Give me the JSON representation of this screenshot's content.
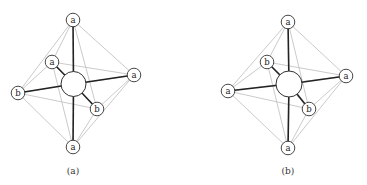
{
  "panels": [
    {
      "caption": "(a)",
      "center": {
        "x": 73.5,
        "y": 84,
        "r": 12.5
      },
      "nodes": [
        {
          "id": "top",
          "label": "a",
          "x": 73,
          "y": 20
        },
        {
          "id": "upper-left",
          "label": "a",
          "x": 52,
          "y": 62
        },
        {
          "id": "right",
          "label": "a",
          "x": 134,
          "y": 75
        },
        {
          "id": "left",
          "label": "b",
          "x": 18,
          "y": 93
        },
        {
          "id": "lower-right",
          "label": "b",
          "x": 97,
          "y": 109
        },
        {
          "id": "bottom",
          "label": "a",
          "x": 73,
          "y": 147
        }
      ]
    },
    {
      "caption": "(b)",
      "center": {
        "x": 289,
        "y": 84,
        "r": 13
      },
      "nodes": [
        {
          "id": "top",
          "label": "a",
          "x": 288,
          "y": 22
        },
        {
          "id": "upper-left",
          "label": "b",
          "x": 267,
          "y": 62
        },
        {
          "id": "right",
          "label": "a",
          "x": 346,
          "y": 76
        },
        {
          "id": "left",
          "label": "a",
          "x": 228,
          "y": 91
        },
        {
          "id": "lower-right",
          "label": "b",
          "x": 309,
          "y": 109
        },
        {
          "id": "bottom",
          "label": "a",
          "x": 288,
          "y": 148
        }
      ]
    }
  ],
  "colors": {
    "edge": "#c4c4c4",
    "bond": "#222222",
    "node_stroke": "#333333"
  },
  "node_radius": 6.8
}
